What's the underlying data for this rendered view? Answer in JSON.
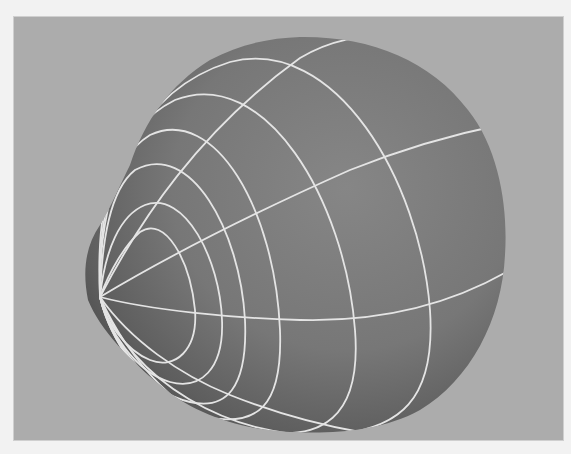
{
  "viewport": {
    "label": "3D perspective viewport",
    "background_color": "#acacac",
    "page_color": "#f2f2f2",
    "frame": {
      "x": 14,
      "y": 17,
      "width": 549,
      "height": 423
    }
  },
  "object": {
    "type": "NURBS sphere (deformed)",
    "shading": "smooth shaded with wireframe isoparms",
    "surface_color_light": "#858585",
    "surface_color_mid": "#767676",
    "surface_color_dark": "#4c4c4c",
    "wire_color": "#e6e6e6",
    "pole_position": {
      "x": 100,
      "y": 297
    },
    "isoparm_rings_visible": 6,
    "meridians_visible": 5
  }
}
